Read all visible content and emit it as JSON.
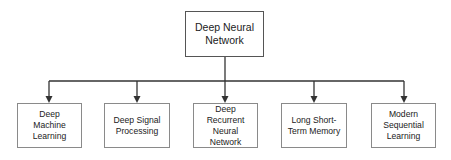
{
  "diagram": {
    "root": {
      "label": "Deep Neural\nNetwork"
    },
    "children": [
      {
        "label": "Deep\nMachine\nLearning"
      },
      {
        "label": "Deep Signal\nProcessing"
      },
      {
        "label": "Deep\nRecurrent\nNeural Network"
      },
      {
        "label": "Long Short-\nTerm Memory"
      },
      {
        "label": "Modern\nSequential\nLearning"
      }
    ],
    "colors": {
      "line": "#333333",
      "border": "#8a8a8a",
      "text": "#222222"
    }
  }
}
